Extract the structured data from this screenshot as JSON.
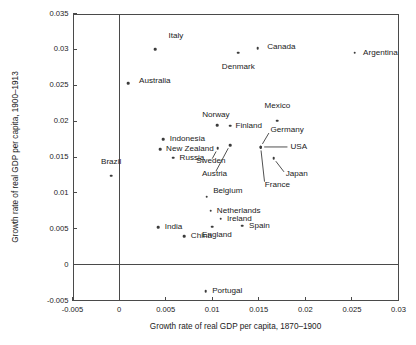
{
  "chart_data": {
    "type": "scatter",
    "title": "",
    "xlabel": "Growth rate of real GDP per capita, 1870–1900",
    "ylabel": "Growth rate of real GDP per capita, 1900–1913",
    "xlim": [
      -0.005,
      0.03
    ],
    "ylim": [
      -0.005,
      0.035
    ],
    "xticks": [
      "-0.005",
      "0",
      "0.005",
      "0.01",
      "0.015",
      "0.02",
      "0.025",
      "0.03"
    ],
    "xtick_values": [
      -0.005,
      0,
      0.005,
      0.01,
      0.015,
      0.02,
      0.025,
      0.03
    ],
    "yticks": [
      "-0.005",
      "0",
      "0.005",
      "0.01",
      "0.015",
      "0.02",
      "0.025",
      "0.03",
      "0.035"
    ],
    "ytick_values": [
      -0.005,
      0,
      0.005,
      0.01,
      0.015,
      0.02,
      0.025,
      0.03,
      0.035
    ],
    "grid": false,
    "legend": "none",
    "zero_lines": {
      "vertical_x": 0,
      "horizontal_y": 0
    },
    "points": [
      {
        "label": "Italy",
        "x": 0.0039,
        "y": 0.03005,
        "lx": 0.0053,
        "ly": 0.0318,
        "anchor": "left",
        "leader": false
      },
      {
        "label": "Canada",
        "x": 0.0149,
        "y": 0.03015,
        "lx": 0.0159,
        "ly": 0.0303,
        "anchor": "left",
        "leader": false
      },
      {
        "label": "Argentina",
        "x": 0.0253,
        "y": 0.02955,
        "lx": 0.0262,
        "ly": 0.02955,
        "anchor": "left",
        "leader": false
      },
      {
        "label": "Denmark",
        "x": 0.0128,
        "y": 0.02955,
        "lx": 0.0128,
        "ly": 0.0276,
        "anchor": "center",
        "leader": false
      },
      {
        "label": "Australia",
        "x": 0.001,
        "y": 0.0253,
        "lx": 0.00215,
        "ly": 0.0256,
        "anchor": "left",
        "leader": false
      },
      {
        "label": "Mexico",
        "x": 0.017,
        "y": 0.02005,
        "lx": 0.017,
        "ly": 0.0221,
        "anchor": "center",
        "leader": false
      },
      {
        "label": "Norway",
        "x": 0.01055,
        "y": 0.0194,
        "lx": 0.0104,
        "ly": 0.0209,
        "anchor": "center",
        "leader": false
      },
      {
        "label": "Finland",
        "x": 0.0119,
        "y": 0.01935,
        "lx": 0.0125,
        "ly": 0.01935,
        "anchor": "left",
        "leader": false
      },
      {
        "label": "Indonesia",
        "x": 0.00475,
        "y": 0.01745,
        "lx": 0.00545,
        "ly": 0.01745,
        "anchor": "left",
        "leader": false
      },
      {
        "label": "Germany",
        "x": 0.0152,
        "y": 0.0164,
        "lx": 0.01625,
        "ly": 0.0187,
        "anchor": "left",
        "leader": true
      },
      {
        "label": "New Zealand",
        "x": 0.0044,
        "y": 0.01605,
        "lx": 0.00505,
        "ly": 0.01605,
        "anchor": "left",
        "leader": false
      },
      {
        "label": "USA",
        "x": 0.0152,
        "y": 0.0164,
        "lx": 0.0184,
        "ly": 0.0164,
        "anchor": "left",
        "leader": true
      },
      {
        "label": "Russia",
        "x": 0.0058,
        "y": 0.0149,
        "lx": 0.0065,
        "ly": 0.0149,
        "anchor": "left",
        "leader": false
      },
      {
        "label": "Sweden",
        "x": 0.0106,
        "y": 0.0162,
        "lx": 0.00985,
        "ly": 0.0144,
        "anchor": "center",
        "leader": true
      },
      {
        "label": "Austria",
        "x": 0.0119,
        "y": 0.01665,
        "lx": 0.01025,
        "ly": 0.01265,
        "anchor": "center",
        "leader": true
      },
      {
        "label": "Japan",
        "x": 0.0166,
        "y": 0.0148,
        "lx": 0.0179,
        "ly": 0.0126,
        "anchor": "left",
        "leader": true
      },
      {
        "label": "France",
        "x": 0.0152,
        "y": 0.0164,
        "lx": 0.01565,
        "ly": 0.01115,
        "anchor": "left",
        "leader": true
      },
      {
        "label": "Brazil",
        "x": -0.00085,
        "y": 0.0124,
        "lx": -0.00085,
        "ly": 0.01425,
        "anchor": "center",
        "leader": false
      },
      {
        "label": "Belgium",
        "x": 0.0094,
        "y": 0.00945,
        "lx": 0.0101,
        "ly": 0.0102,
        "anchor": "left",
        "leader": false
      },
      {
        "label": "Netherlands",
        "x": 0.00985,
        "y": 0.0075,
        "lx": 0.0105,
        "ly": 0.0075,
        "anchor": "left",
        "leader": false
      },
      {
        "label": "Ireland",
        "x": 0.0109,
        "y": 0.0064,
        "lx": 0.0116,
        "ly": 0.0064,
        "anchor": "left",
        "leader": false
      },
      {
        "label": "Spain",
        "x": 0.01325,
        "y": 0.0054,
        "lx": 0.01395,
        "ly": 0.0054,
        "anchor": "left",
        "leader": false
      },
      {
        "label": "England",
        "x": 0.01,
        "y": 0.0053,
        "lx": 0.0105,
        "ly": 0.00415,
        "anchor": "center",
        "leader": false
      },
      {
        "label": "India",
        "x": 0.0042,
        "y": 0.00525,
        "lx": 0.0049,
        "ly": 0.00525,
        "anchor": "left",
        "leader": false
      },
      {
        "label": "China",
        "x": 0.007,
        "y": 0.00395,
        "lx": 0.0077,
        "ly": 0.00395,
        "anchor": "left",
        "leader": false
      },
      {
        "label": "Portugal",
        "x": 0.0093,
        "y": -0.0037,
        "lx": 0.01,
        "ly": -0.0037,
        "anchor": "left",
        "leader": false
      }
    ]
  }
}
